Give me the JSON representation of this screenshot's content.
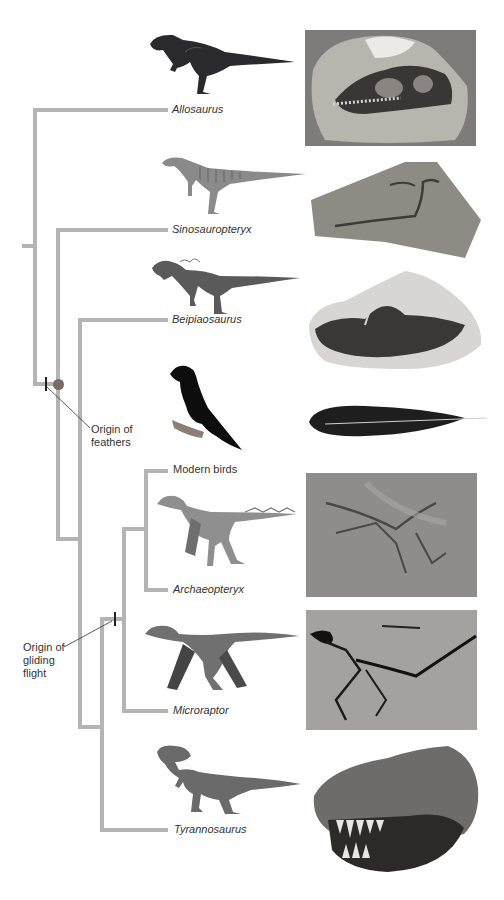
{
  "figure": {
    "type": "phylogenetic-tree",
    "colors": {
      "branch": "#b4b4b4",
      "text": "#333333",
      "node_dot": "#7a6a66",
      "tick": "#222222"
    }
  },
  "taxa": [
    {
      "id": "allosaurus",
      "label": "Allosaurus",
      "italic": true,
      "illustration": "allosaurus-illustration",
      "photo": "allosaurus-skull-fossil-photo"
    },
    {
      "id": "sinosauropteryx",
      "label": "Sinosauropteryx",
      "italic": true,
      "illustration": "sinosauropteryx-illustration",
      "photo": "sinosauropteryx-slab-fossil-photo"
    },
    {
      "id": "beipiaosaurus",
      "label": "Beipiaosaurus",
      "italic": true,
      "illustration": "beipiaosaurus-illustration",
      "photo": "beipiaosaurus-fossil-photo"
    },
    {
      "id": "modern-birds",
      "label": "Modern birds",
      "italic": false,
      "illustration": "crow-illustration",
      "photo": "black-feather-photo"
    },
    {
      "id": "archaeopteryx",
      "label": "Archaeopteryx",
      "italic": true,
      "illustration": "archaeopteryx-illustration",
      "photo": "archaeopteryx-fossil-photo"
    },
    {
      "id": "microraptor",
      "label": "Microraptor",
      "italic": true,
      "illustration": "microraptor-illustration",
      "photo": "microraptor-fossil-photo"
    },
    {
      "id": "tyrannosaurus",
      "label": "Tyrannosaurus",
      "italic": true,
      "illustration": "tyrannosaurus-illustration",
      "photo": "tyrannosaurus-skull-photo"
    }
  ],
  "annotations": {
    "feathers": {
      "line1": "Origin of",
      "line2": "feathers"
    },
    "gliding": {
      "line1": "Origin of",
      "line2": "gliding",
      "line3": "flight"
    }
  }
}
